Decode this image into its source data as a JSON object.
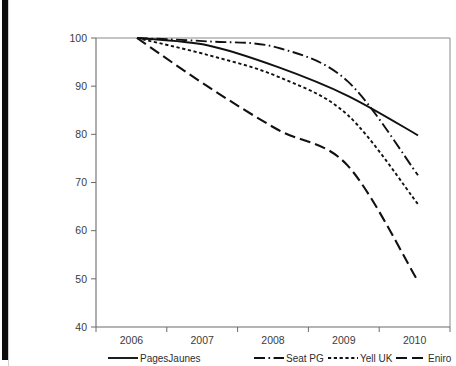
{
  "chart_data": {
    "type": "line",
    "title": "",
    "subtitle": "",
    "xlabel": "",
    "ylabel": "",
    "categories": [
      "2006",
      "2007",
      "2008",
      "2009",
      "2010"
    ],
    "x": [
      2006,
      2007,
      2008,
      2009,
      2010
    ],
    "xlim": [
      2006,
      2010
    ],
    "ylim": [
      40,
      100
    ],
    "yticks": [
      40,
      50,
      60,
      70,
      80,
      90,
      100
    ],
    "ytick_labels": [
      "40",
      "50",
      "60",
      "70",
      "80",
      "90",
      "100"
    ],
    "xtick_labels": [
      "2006",
      "2007",
      "2008",
      "2009",
      "2010"
    ],
    "grid": false,
    "legend_position": "bottom",
    "series": [
      {
        "name": "PagesJaunes",
        "line_style": "solid",
        "color": "#111111",
        "values": [
          100,
          98.5,
          94,
          88,
          79.8
        ]
      },
      {
        "name": "Seat PG",
        "line_style": "dash-dot",
        "color": "#111111",
        "values": [
          100,
          99.3,
          98,
          91,
          71.5
        ]
      },
      {
        "name": "Yell UK",
        "line_style": "dotted",
        "color": "#111111",
        "values": [
          100,
          96.5,
          92,
          84,
          65.5
        ]
      },
      {
        "name": "Eniro",
        "line_style": "long-dash",
        "color": "#111111",
        "values": [
          100,
          90,
          81,
          73.5,
          49.5
        ]
      }
    ]
  },
  "legend": {
    "items": [
      {
        "label": "PagesJaunes",
        "style": "solid"
      },
      {
        "label": "Seat PG",
        "style": "dash-dot"
      },
      {
        "label": "Yell UK",
        "style": "dotted"
      },
      {
        "label": "Eniro",
        "style": "long-dash"
      }
    ]
  }
}
